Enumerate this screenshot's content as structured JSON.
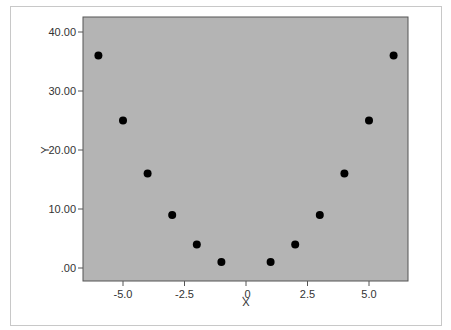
{
  "chart_data": {
    "type": "scatter",
    "title": "",
    "xlabel": "X",
    "ylabel": "Y",
    "xlim": [
      -6.5,
      6.7
    ],
    "ylim": [
      -2.2,
      42.5
    ],
    "x_ticks": [
      -5.0,
      -2.5,
      0.0,
      2.5,
      5.0
    ],
    "x_tick_labels": [
      "-5.0",
      "-2.5",
      ".0",
      "2.5",
      "5.0"
    ],
    "y_ticks": [
      0,
      10,
      20,
      30,
      40
    ],
    "y_tick_labels": [
      ".00",
      "10.00",
      "20.00",
      "30.00",
      "40.00"
    ],
    "grid": false,
    "legend": null,
    "series": [
      {
        "name": "Y",
        "x": [
          -6,
          -5,
          -4,
          -3,
          -2,
          -1,
          1,
          2,
          3,
          4,
          5,
          6
        ],
        "y": [
          36,
          25,
          16,
          9,
          4,
          1,
          1,
          4,
          9,
          16,
          25,
          36
        ],
        "color": "#000000"
      }
    ],
    "plot_background": "#b4b4b4"
  }
}
